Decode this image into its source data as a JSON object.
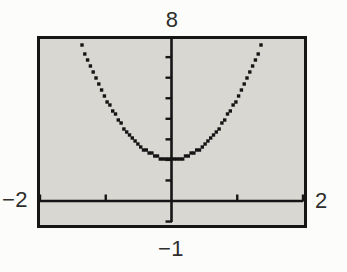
{
  "figure": {
    "labels": {
      "ymax": "8",
      "xmin": "−2",
      "xmax": "2",
      "ymin": "−1"
    }
  },
  "colors": {
    "page_background": "#fcfcfb",
    "screen_background": "#d8d7d2",
    "border": "#161616",
    "axis": "#161616",
    "curve": "#141414",
    "label_text": "#2e2e2e"
  },
  "chart_data": {
    "type": "line",
    "style": "calculator-dot-mode-pixels",
    "estimated_function": "y = 3x^2 + 2",
    "coefficients": {
      "a": 3,
      "b": 0,
      "c": 2
    },
    "window": {
      "xmin": -2,
      "xmax": 2,
      "ymin": -1,
      "ymax": 8
    },
    "window_labels": {
      "top": "8",
      "left": "−2",
      "right": "2",
      "bottom": "−1"
    },
    "x_ticks": [
      -2,
      -1,
      1,
      2
    ],
    "y_ticks": [
      -1,
      1,
      2,
      3,
      4,
      5,
      6,
      7
    ],
    "vertex": [
      0,
      2
    ],
    "grid": false,
    "legend": false,
    "points": [
      {
        "x": -1.4,
        "y": 7.88
      },
      {
        "x": -1.2,
        "y": 6.32
      },
      {
        "x": -1.0,
        "y": 5.0
      },
      {
        "x": -0.8,
        "y": 3.92
      },
      {
        "x": -0.6,
        "y": 3.08
      },
      {
        "x": -0.4,
        "y": 2.48
      },
      {
        "x": -0.2,
        "y": 2.12
      },
      {
        "x": 0.0,
        "y": 2.0
      },
      {
        "x": 0.2,
        "y": 2.12
      },
      {
        "x": 0.4,
        "y": 2.48
      },
      {
        "x": 0.6,
        "y": 3.08
      },
      {
        "x": 0.8,
        "y": 3.92
      },
      {
        "x": 1.0,
        "y": 5.0
      },
      {
        "x": 1.2,
        "y": 6.32
      },
      {
        "x": 1.4,
        "y": 7.88
      }
    ]
  }
}
